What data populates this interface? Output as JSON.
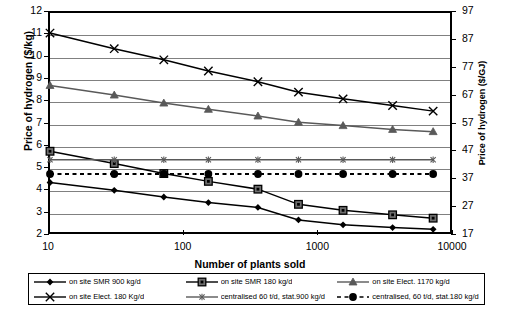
{
  "chart_data": {
    "type": "line",
    "title": "",
    "xlabel": "Number of plants sold",
    "ylabel": "Price of hydrogen ($/kg)",
    "ylabel_right": "Price of hydrogen ($/GJ)",
    "xscale": "log",
    "xlim": [
      10,
      10000
    ],
    "ylim": [
      2,
      12
    ],
    "ylim_right": [
      17,
      97
    ],
    "grid": true,
    "legend_position": "bottom",
    "xticks": [
      {
        "value": 10,
        "label": "10"
      },
      {
        "value": 100,
        "label": "100"
      },
      {
        "value": 1000,
        "label": "1000"
      },
      {
        "value": 10000,
        "label": "10000"
      }
    ],
    "yticks_left": [
      "2",
      "3",
      "4",
      "5",
      "6",
      "7",
      "8",
      "9",
      "10",
      "11",
      "12"
    ],
    "yticks_right": [
      "17",
      "27",
      "37",
      "47",
      "57",
      "67",
      "77",
      "87",
      "97"
    ],
    "x": [
      10,
      30,
      70,
      150,
      350,
      700,
      1500,
      3500,
      7000
    ],
    "series": [
      {
        "name": "on site SMR 900 kg/d",
        "marker": "diamond",
        "color": "#000000",
        "dashed": false,
        "values": [
          4.4,
          4.05,
          3.75,
          3.5,
          3.28,
          2.72,
          2.5,
          2.38,
          2.3
        ]
      },
      {
        "name": "on site SMR 180 kg/d",
        "marker": "square",
        "color": "#000000",
        "dashed": false,
        "values": [
          5.8,
          5.25,
          4.8,
          4.45,
          4.1,
          3.42,
          3.15,
          2.95,
          2.8
        ]
      },
      {
        "name": "on site Elect. 1170 kg/d",
        "marker": "triangle",
        "color": "#595959",
        "dashed": false,
        "values": [
          8.75,
          8.32,
          7.96,
          7.68,
          7.38,
          7.1,
          6.95,
          6.78,
          6.68
        ]
      },
      {
        "name": "on site Elect. 180 Kg/d",
        "marker": "cross",
        "color": "#000000",
        "dashed": false,
        "values": [
          11.1,
          10.4,
          9.9,
          9.4,
          8.92,
          8.45,
          8.15,
          7.85,
          7.6
        ]
      },
      {
        "name": "centralised 60 t/d, stat.900 kg/d",
        "marker": "star",
        "color": "#595959",
        "dashed": false,
        "values": [
          5.42,
          5.42,
          5.42,
          5.42,
          5.42,
          5.42,
          5.42,
          5.42,
          5.42
        ]
      },
      {
        "name": "centralised, 60 t/d, stat.180 kg/d",
        "marker": "circle",
        "color": "#000000",
        "dashed": true,
        "values": [
          4.78,
          4.78,
          4.78,
          4.78,
          4.78,
          4.78,
          4.78,
          4.78,
          4.78
        ]
      }
    ]
  },
  "legend": {
    "items": [
      {
        "label": "on site SMR 900 kg/d",
        "marker": "diamond"
      },
      {
        "label": "on site SMR 180 kg/d",
        "marker": "square"
      },
      {
        "label": "on site Elect. 1170 kg/d",
        "marker": "triangle"
      },
      {
        "label": "on site Elect. 180 Kg/d",
        "marker": "cross"
      },
      {
        "label": "centralised 60 t/d, stat.900 kg/d",
        "marker": "star"
      },
      {
        "label": "centralised, 60 t/d, stat.180 kg/d",
        "marker": "circle"
      }
    ]
  },
  "colors": {
    "axis": "#000000",
    "grid": "#808080",
    "gray_series": "#595959"
  }
}
